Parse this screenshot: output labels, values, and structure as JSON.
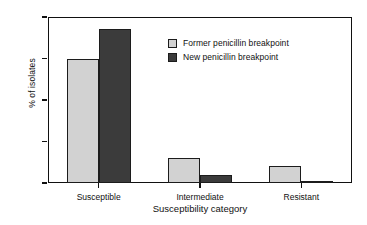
{
  "chart_data": {
    "type": "bar",
    "title": "",
    "xlabel": "Susceptibility category",
    "ylabel": "% of isolates",
    "categories": [
      "Susceptible",
      "Intermediate",
      "Resistant"
    ],
    "series": [
      {
        "name": "Former penicillin breakpoint",
        "values": [
          75,
          15,
          10
        ],
        "color": "#d2d2d2"
      },
      {
        "name": "New penicillin breakpoint",
        "values": [
          93,
          5,
          1
        ],
        "color": "#3b3b3b"
      }
    ],
    "ylim": [
      0,
      100
    ],
    "yticks": [
      0,
      25,
      50,
      75,
      100
    ],
    "ytick_labels": [
      "0",
      "25",
      "50",
      "75",
      "100"
    ],
    "grid": false,
    "legend_position": "upper center",
    "frame": "box",
    "axis_color": "#111111",
    "bar_edge_color": "#1c1c1c",
    "background": "#ffffff"
  }
}
